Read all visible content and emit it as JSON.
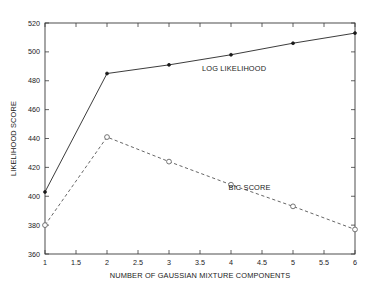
{
  "chart_data": {
    "type": "line",
    "title": "",
    "xlabel": "NUMBER OF GAUSSIAN MIXTURE COMPONENTS",
    "ylabel": "LIKELIHOOD SCORE",
    "x": [
      1,
      2,
      3,
      4,
      5,
      6
    ],
    "xlim": [
      1,
      6
    ],
    "ylim": [
      360,
      520
    ],
    "xticks": [
      1,
      1.5,
      2,
      2.5,
      3,
      3.5,
      4,
      4.5,
      5,
      5.5,
      6
    ],
    "xticklabels": [
      "1",
      "1.5",
      "2",
      "2.5",
      "3",
      "3.5",
      "4",
      "4.5",
      "5",
      "5.5",
      "6"
    ],
    "yticks": [
      360,
      380,
      400,
      420,
      440,
      460,
      480,
      500,
      520
    ],
    "yticklabels": [
      "360",
      "380",
      "400",
      "420",
      "440",
      "460",
      "480",
      "500",
      "520"
    ],
    "grid": false,
    "legend_position": "inline-annotations",
    "series": [
      {
        "name": "LOG LIKELIHOOD",
        "values": [
          403,
          485,
          491,
          498,
          506,
          513
        ],
        "line_style": "solid",
        "marker": "filled-circle",
        "color": "#262626",
        "annotation": {
          "text": "LOG LIKELIHOOD",
          "x": 4.05,
          "y": 487
        }
      },
      {
        "name": "BIC SCORE",
        "values": [
          380,
          441,
          424,
          408,
          393,
          377
        ],
        "line_style": "dashed",
        "marker": "open-circle",
        "color": "#555555",
        "annotation": {
          "text": "BIC SCORE",
          "x": 4.3,
          "y": 404
        }
      }
    ]
  }
}
